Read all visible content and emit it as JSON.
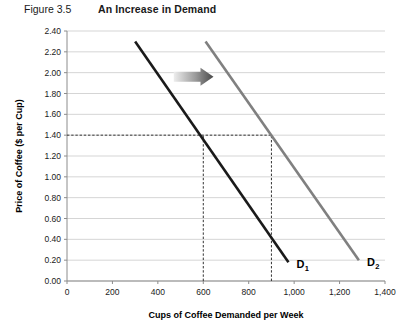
{
  "header": {
    "figure_number": "Figure 3.5",
    "title": "An Increase in Demand"
  },
  "chart_data": {
    "type": "line",
    "title": "An Increase in Demand",
    "xlabel": "Cups of Coffee Demanded per Week",
    "ylabel": "Price of Coffee ($ per Cup)",
    "xlim": [
      0,
      1400
    ],
    "ylim": [
      0.0,
      2.4
    ],
    "xticks": [
      0,
      200,
      400,
      600,
      800,
      1000,
      1200,
      1400
    ],
    "xtick_labels": [
      "0",
      "200",
      "400",
      "600",
      "800",
      "1,000",
      "1,200",
      "1,400"
    ],
    "yticks": [
      0.0,
      0.2,
      0.4,
      0.6,
      0.8,
      1.0,
      1.2,
      1.4,
      1.6,
      1.8,
      2.0,
      2.2,
      2.4
    ],
    "ytick_labels": [
      "0.00",
      "0.20",
      "0.40",
      "0.60",
      "0.80",
      "1.00",
      "1.20",
      "1.40",
      "1.60",
      "1.80",
      "2.00",
      "2.20",
      "2.40"
    ],
    "grid": "horizontal",
    "legend": "inline-labels",
    "series": [
      {
        "name": "D1",
        "label": "D",
        "subscript": "1",
        "color": "#1a1a1a",
        "points": [
          [
            300,
            2.3
          ],
          [
            975,
            0.18
          ]
        ]
      },
      {
        "name": "D2",
        "label": "D",
        "subscript": "2",
        "color": "#808080",
        "points": [
          [
            610,
            2.3
          ],
          [
            1285,
            0.2
          ]
        ]
      }
    ],
    "annotations": [
      {
        "type": "shift-arrow",
        "direction": "right",
        "color_start": "#e8e8e8",
        "color_end": "#4d4d4d",
        "x_from": 470,
        "x_to": 645,
        "y": 1.96
      },
      {
        "type": "guide-line",
        "orientation": "horizontal",
        "value": 1.4,
        "from_x": 0,
        "to_x": 900
      },
      {
        "type": "guide-line",
        "orientation": "vertical",
        "value": 600,
        "from_y": 0.0,
        "to_y": 1.4
      },
      {
        "type": "guide-line",
        "orientation": "vertical",
        "value": 900,
        "from_y": 0.0,
        "to_y": 1.4
      }
    ]
  }
}
